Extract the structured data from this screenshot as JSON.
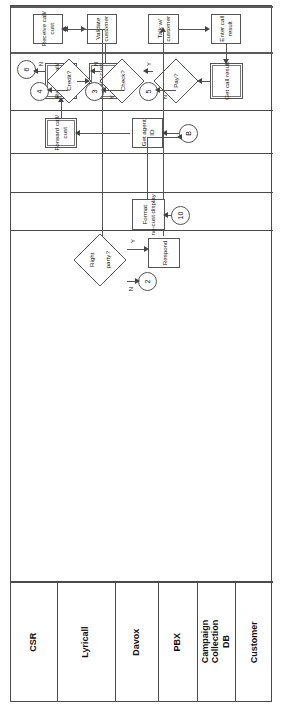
{
  "diagram": {
    "orientation": "rotated-90",
    "lanes": [
      {
        "id": "csr",
        "label": "CSR"
      },
      {
        "id": "lyricall",
        "label": "Lyricall"
      },
      {
        "id": "davox",
        "label": "Davox"
      },
      {
        "id": "pbx",
        "label": "PBX"
      },
      {
        "id": "ccdb",
        "label": "Campaign\nCollection\nDB"
      },
      {
        "id": "customer",
        "label": "Customer"
      }
    ],
    "lane_labels": {
      "csr": "CSR",
      "lyricall": "Lyricall",
      "davox": "Davox",
      "pbx": "PBX",
      "ccdb_line1": "Campaign",
      "ccdb_line2": "Collection",
      "ccdb_line3": "DB",
      "customer": "Customer"
    },
    "nodes": {
      "enter_call_result": {
        "type": "process",
        "label_line1": "Enter call",
        "label_line2": "result",
        "lane": "csr"
      },
      "talk_w_customer": {
        "type": "process",
        "label_line1": "Talk w/",
        "label_line2": "customer",
        "lane": "csr"
      },
      "validate_customer": {
        "type": "process",
        "label_line1": "Validate",
        "label_line2": "customer",
        "lane": "csr"
      },
      "receive_call_cust_csr": {
        "type": "process",
        "label_line1": "Receive call/",
        "label_line2": "cust",
        "lane": "csr"
      },
      "get_call_result": {
        "type": "process",
        "label_line1": "Get call result",
        "label_line2": "",
        "lane": "lyricall"
      },
      "display_cust_info": {
        "type": "process",
        "label_line1": "Display cust",
        "label_line2": "info",
        "lane": "lyricall"
      },
      "receive_call_cust_ly": {
        "type": "process",
        "label_line1": "Receive call/",
        "label_line2": "cust",
        "lane": "lyricall"
      },
      "forward_call_cust": {
        "type": "process",
        "label_line1": "Forward call/",
        "label_line2": "cust",
        "lane": "davox"
      },
      "get_agent_id": {
        "type": "process",
        "label_line1": "Get agent",
        "label_line2": "ID",
        "lane": "davox"
      },
      "format_no_cust": {
        "type": "process",
        "label_line1": "Format",
        "label_line2": "no-cust display",
        "lane": "ccdb"
      },
      "respond": {
        "type": "process",
        "label_line1": "Respond",
        "label_line2": "",
        "lane": "customer"
      },
      "credit_decision": {
        "type": "decision",
        "label": "Credit?",
        "lane": "lyricall"
      },
      "check_decision": {
        "type": "decision",
        "label": "Check?",
        "lane": "lyricall"
      },
      "pay_decision": {
        "type": "decision",
        "label": "Pay?",
        "lane": "lyricall"
      },
      "right_party_decision": {
        "type": "decision",
        "label_line1": "Right",
        "label_line2": "party?",
        "lane": "customer"
      }
    },
    "connectors": [
      {
        "id": "c6",
        "label": "6",
        "lane": "lyricall"
      },
      {
        "id": "c4",
        "label": "4",
        "lane": "lyricall"
      },
      {
        "id": "c3",
        "label": "3",
        "lane": "lyricall"
      },
      {
        "id": "c5",
        "label": "5",
        "lane": "lyricall"
      },
      {
        "id": "c2",
        "label": "2",
        "lane": "customer"
      },
      {
        "id": "cB",
        "label": "B",
        "lane": "davox"
      },
      {
        "id": "c10",
        "label": "10",
        "lane": "ccdb"
      }
    ],
    "edge_labels": {
      "credit_n": "N",
      "credit_y": "Y",
      "check_n": "N",
      "check_y": "Y",
      "pay_y": "Y",
      "pay_n": "N",
      "rightparty_y": "Y",
      "rightparty_n": "N"
    },
    "colors": {
      "line": "#555555",
      "frame": "#4a4a4a",
      "background": "#ffffff",
      "text": "#111111"
    }
  }
}
